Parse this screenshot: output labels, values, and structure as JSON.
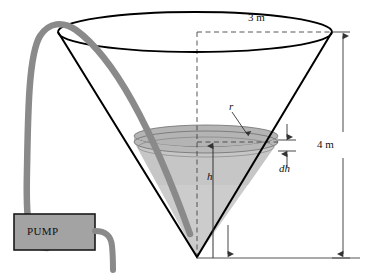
{
  "figure": {
    "type": "technical-diagram"
  },
  "labels": {
    "top_diameter": "3 m",
    "tank_height": "4 m",
    "radius_symbol": "r",
    "water_height_symbol": "h",
    "slice_thickness_symbol": "dh",
    "pump": "PUMP"
  },
  "colors": {
    "outline": "#000000",
    "hose": "#808080",
    "pump_fill": "#a0a0a0",
    "water_light": "#c6c6c6",
    "water_surface": "#b0b0b0",
    "dimension_line": "#555555",
    "background": "#ffffff"
  },
  "geometry": {
    "cone_apex": {
      "x": 197,
      "y": 257
    },
    "cone_top_center": {
      "x": 195,
      "y": 32
    },
    "cone_top_rx": 137,
    "cone_top_ry": 20,
    "water_surface_center": {
      "x": 206,
      "y": 142
    },
    "water_surface_rx": 72,
    "water_surface_ry": 11,
    "baseline_y": 258
  },
  "icon_names": {
    "hose": "hose-icon",
    "pump_box": "pump-box-icon",
    "arrow": "arrow-icon"
  }
}
